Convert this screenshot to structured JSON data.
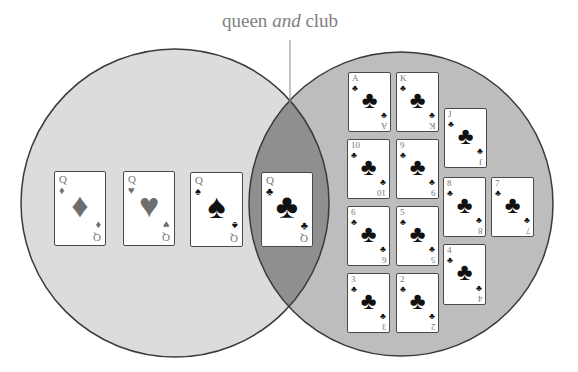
{
  "label": {
    "part1": "queen ",
    "part2": "and",
    "part3": " club"
  },
  "diagram": {
    "type": "venn",
    "left_set": "queens",
    "right_set": "clubs",
    "intersection": "queen and club",
    "colors": {
      "left_fill": "#dcdcdc",
      "right_fill": "#bdbdbd",
      "intersection_fill": "#8f8f8f",
      "outline": "#3a3a3a",
      "label": "#7f7f7f"
    }
  },
  "cards": {
    "left_only": [
      {
        "rank": "Q",
        "suit": "♦",
        "suit_name": "diamonds"
      },
      {
        "rank": "Q",
        "suit": "♥",
        "suit_name": "hearts"
      },
      {
        "rank": "Q",
        "suit": "♠",
        "suit_name": "spades"
      }
    ],
    "intersection": [
      {
        "rank": "Q",
        "suit": "♣",
        "suit_name": "clubs"
      }
    ],
    "right_only": [
      {
        "rank": "A",
        "suit": "♣"
      },
      {
        "rank": "K",
        "suit": "♣"
      },
      {
        "rank": "J",
        "suit": "♣"
      },
      {
        "rank": "10",
        "suit": "♣"
      },
      {
        "rank": "9",
        "suit": "♣"
      },
      {
        "rank": "8",
        "suit": "♣"
      },
      {
        "rank": "7",
        "suit": "♣"
      },
      {
        "rank": "6",
        "suit": "♣"
      },
      {
        "rank": "5",
        "suit": "♣"
      },
      {
        "rank": "4",
        "suit": "♣"
      },
      {
        "rank": "3",
        "suit": "♣"
      },
      {
        "rank": "2",
        "suit": "♣"
      }
    ]
  }
}
